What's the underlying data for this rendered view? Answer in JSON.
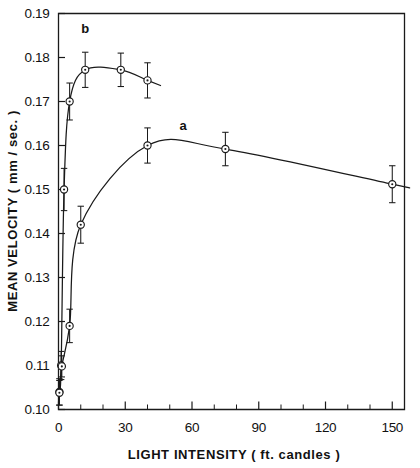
{
  "chart_data": {
    "type": "line",
    "title": "",
    "subtitle": "",
    "xlabel": "LIGHT  INTENSITY  ( ft. candles )",
    "ylabel": "MEAN  VELOCITY  ( mm / sec. )",
    "xlim": [
      0,
      155.5
    ],
    "ylim": [
      0.1,
      0.19
    ],
    "grid": false,
    "legend_position": "inline-annotation",
    "x_ticks_major": [
      0,
      30,
      60,
      90,
      120,
      150
    ],
    "x_tick_labels": [
      "0",
      "30",
      "60",
      "90",
      "120",
      "150"
    ],
    "x_ticks_minor": [
      10,
      20,
      40,
      50,
      70,
      80,
      100,
      110,
      130,
      140
    ],
    "y_ticks": [
      0.1,
      0.11,
      0.12,
      0.13,
      0.14,
      0.15,
      0.16,
      0.17,
      0.18,
      0.19
    ],
    "y_tick_labels": [
      "0.10",
      "0.11",
      "0.12",
      "0.13",
      "0.14",
      "0.15",
      "0.16",
      "0.17",
      "0.18",
      "0.19"
    ],
    "marker_style": "open-circle-with-center-dot",
    "error_bar_style": "vertical-capped",
    "series": [
      {
        "name": "b",
        "annotation_label": "b",
        "annotation_x": 12,
        "annotation_y": 0.1855,
        "x": [
          0.4,
          1.2,
          2.5,
          5.0,
          12.0,
          28.0,
          40.0
        ],
        "y": [
          0.104,
          0.11,
          0.15,
          0.17,
          0.1772,
          0.1772,
          0.1748
        ],
        "yerr": [
          0.003,
          0.0032,
          0.0048,
          0.0042,
          0.004,
          0.0038,
          0.004
        ]
      },
      {
        "name": "a",
        "annotation_label": "a",
        "annotation_x": 56,
        "annotation_y": 0.1635,
        "x": [
          0.4,
          1.5,
          5.0,
          10.0,
          40.0,
          75.0,
          150.0
        ],
        "y": [
          0.1038,
          0.1098,
          0.119,
          0.142,
          0.16,
          0.1592,
          0.1512
        ],
        "yerr": [
          0.0028,
          0.0024,
          0.0038,
          0.0042,
          0.004,
          0.0038,
          0.0042
        ]
      }
    ]
  },
  "figure": {
    "background_color": "#ffffff",
    "ink_color": "#1a1a1a",
    "frame_visible": true
  }
}
